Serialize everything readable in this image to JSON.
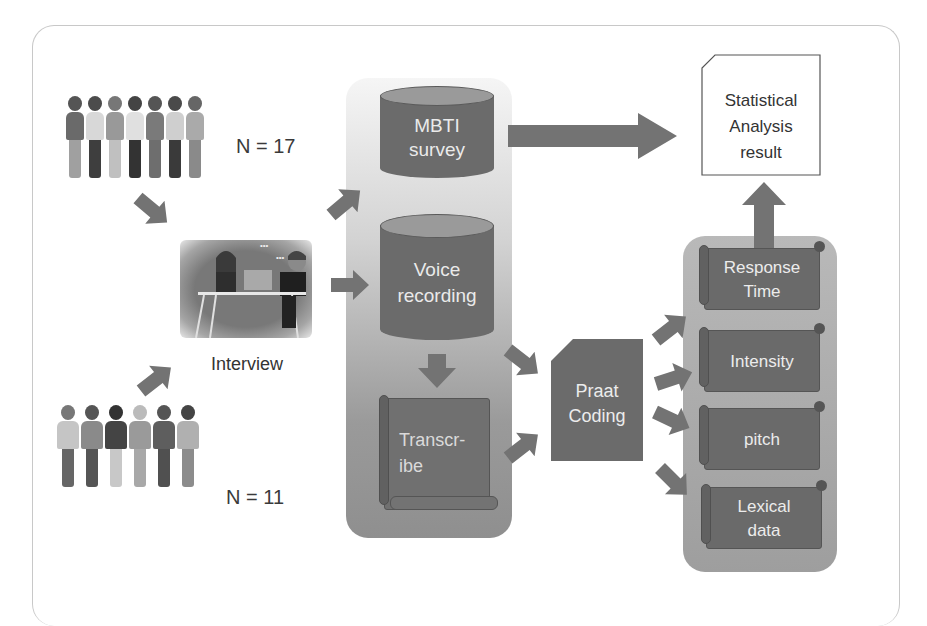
{
  "diagram": {
    "title": "",
    "participants": {
      "women_group": {
        "icon": "women-group-illustration",
        "count_label": "N = 17"
      },
      "men_group": {
        "icon": "men-group-illustration",
        "count_label": "N = 11"
      }
    },
    "interview": {
      "icon": "interview-illustration",
      "label": "Interview"
    },
    "data_sources": {
      "mbti": {
        "line1": "MBTI",
        "line2": "survey"
      },
      "voice": {
        "line1": "Voice",
        "line2": "recording"
      },
      "transcribe": {
        "line1": "Transcr-",
        "line2": "ibe"
      }
    },
    "praat": {
      "line1": "Praat",
      "line2": "Coding"
    },
    "features": [
      {
        "line1": "Response",
        "line2": "Time"
      },
      {
        "line1": "Intensity",
        "line2": ""
      },
      {
        "line1": "pitch",
        "line2": ""
      },
      {
        "line1": "Lexical",
        "line2": "data"
      }
    ],
    "result": {
      "line1": "Statistical",
      "line2": "Analysis",
      "line3": "result"
    },
    "colors": {
      "node_fill": "#6b6b6b",
      "arrow_fill": "#737373",
      "panel_fill": "#9e9e9e",
      "text_dark": "#333333",
      "text_light": "#ececec"
    }
  }
}
